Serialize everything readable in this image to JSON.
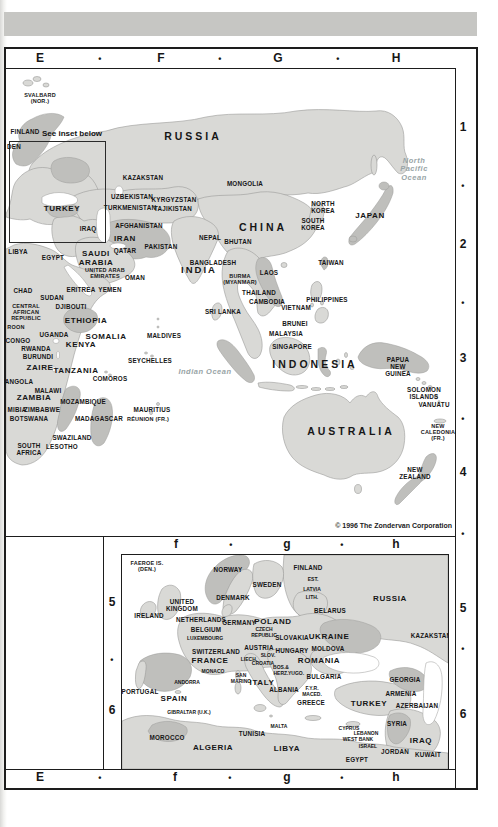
{
  "page": {
    "copyright": "© 1996 The Zondervan Corporation",
    "inset_note": "See inset below",
    "colors": {
      "top_bar": "#c6c6c3",
      "land": "#d9d9d6",
      "land_dark": "#bfbfbc",
      "ocean": "#ffffff",
      "frame": "#1d1d1d"
    }
  },
  "grid": {
    "top": [
      {
        "t": "E",
        "x": 40,
        "y": 59,
        "cls": "grid"
      },
      {
        "t": "•",
        "x": 100,
        "y": 59,
        "cls": "dot"
      },
      {
        "t": "F",
        "x": 161,
        "y": 59,
        "cls": "grid"
      },
      {
        "t": "•",
        "x": 220,
        "y": 59,
        "cls": "dot"
      },
      {
        "t": "G",
        "x": 278,
        "y": 59,
        "cls": "grid"
      },
      {
        "t": "•",
        "x": 338,
        "y": 59,
        "cls": "dot"
      },
      {
        "t": "H",
        "x": 396,
        "y": 59,
        "cls": "grid"
      }
    ],
    "bottom": [
      {
        "t": "E",
        "x": 40,
        "y": 778,
        "cls": "grid"
      },
      {
        "t": "•",
        "x": 100,
        "y": 778,
        "cls": "dot"
      },
      {
        "t": "f",
        "x": 175,
        "y": 778,
        "cls": "grid"
      },
      {
        "t": "•",
        "x": 230,
        "y": 778,
        "cls": "dot"
      },
      {
        "t": "g",
        "x": 287,
        "y": 778,
        "cls": "grid"
      },
      {
        "t": "•",
        "x": 342,
        "y": 778,
        "cls": "dot"
      },
      {
        "t": "h",
        "x": 396,
        "y": 778,
        "cls": "grid"
      }
    ],
    "right": [
      {
        "t": "1",
        "x": 463,
        "y": 128,
        "cls": "grid"
      },
      {
        "t": "•",
        "x": 463,
        "y": 186,
        "cls": "dot"
      },
      {
        "t": "2",
        "x": 463,
        "y": 245,
        "cls": "grid"
      },
      {
        "t": "•",
        "x": 463,
        "y": 303,
        "cls": "dot"
      },
      {
        "t": "3",
        "x": 463,
        "y": 359,
        "cls": "grid"
      },
      {
        "t": "•",
        "x": 463,
        "y": 419,
        "cls": "dot"
      },
      {
        "t": "4",
        "x": 463,
        "y": 473,
        "cls": "grid"
      },
      {
        "t": "•",
        "x": 463,
        "y": 534,
        "cls": "dot"
      },
      {
        "t": "5",
        "x": 463,
        "y": 609,
        "cls": "grid"
      },
      {
        "t": "•",
        "x": 463,
        "y": 649,
        "cls": "dot"
      },
      {
        "t": "6",
        "x": 463,
        "y": 715,
        "cls": "grid"
      }
    ],
    "inset_top": [
      {
        "t": "f",
        "x": 176,
        "y": 545,
        "cls": "grid"
      },
      {
        "t": "•",
        "x": 231,
        "y": 545,
        "cls": "dot"
      },
      {
        "t": "g",
        "x": 287,
        "y": 545,
        "cls": "grid"
      },
      {
        "t": "•",
        "x": 342,
        "y": 545,
        "cls": "dot"
      },
      {
        "t": "h",
        "x": 396,
        "y": 545,
        "cls": "grid"
      }
    ],
    "inset_left": [
      {
        "t": "5",
        "x": 112,
        "y": 603,
        "cls": "grid"
      },
      {
        "t": "•",
        "x": 112,
        "y": 660,
        "cls": "dot"
      },
      {
        "t": "6",
        "x": 112,
        "y": 711,
        "cls": "grid"
      }
    ]
  },
  "main_map": {
    "labels": [
      {
        "t": "SVALBARD\n(NOR.)",
        "x": 34,
        "y": 29,
        "cls": "sm"
      },
      {
        "t": "FINLAND",
        "x": 19,
        "y": 63
      },
      {
        "t": "DEN",
        "x": 8,
        "y": 78
      },
      {
        "t": "RUSSIA",
        "x": 187,
        "y": 68,
        "cls": "xl"
      },
      {
        "t": "KAZAKSTAN",
        "x": 137,
        "y": 109
      },
      {
        "t": "MONGOLIA",
        "x": 239,
        "y": 115
      },
      {
        "t": "UZBEKISTAN",
        "x": 126,
        "y": 128
      },
      {
        "t": "KYRGYZSTAN",
        "x": 168,
        "y": 131
      },
      {
        "t": "TURKMENISTAN",
        "x": 124,
        "y": 139
      },
      {
        "t": "TAJIKISTAN",
        "x": 167,
        "y": 140
      },
      {
        "t": "TURKEY",
        "x": 56,
        "y": 140,
        "cls": "lg"
      },
      {
        "t": "IRAQ",
        "x": 82,
        "y": 160
      },
      {
        "t": "IRAN",
        "x": 119,
        "y": 170,
        "cls": "lg"
      },
      {
        "t": "AFGHANISTAN",
        "x": 133,
        "y": 157
      },
      {
        "t": "PAKISTAN",
        "x": 155,
        "y": 178
      },
      {
        "t": "NEPAL",
        "x": 204,
        "y": 169
      },
      {
        "t": "BHUTAN",
        "x": 232,
        "y": 173
      },
      {
        "t": "CHINA",
        "x": 257,
        "y": 159,
        "cls": "xl"
      },
      {
        "t": "NORTH\nKOREA",
        "x": 317,
        "y": 138
      },
      {
        "t": "SOUTH\nKOREA",
        "x": 307,
        "y": 155
      },
      {
        "t": "JAPAN",
        "x": 364,
        "y": 147,
        "cls": "lg"
      },
      {
        "t": "North\nPacific\nOcean",
        "x": 408,
        "y": 101,
        "cls": "ocean"
      },
      {
        "t": "QATAR",
        "x": 119,
        "y": 182
      },
      {
        "t": "SAUDI\nARABIA",
        "x": 90,
        "y": 190,
        "cls": "lg"
      },
      {
        "t": "EGYPT",
        "x": 47,
        "y": 189
      },
      {
        "t": "LIBYA",
        "x": 12,
        "y": 183
      },
      {
        "t": "UNITED ARAB\nEMIRATES",
        "x": 99,
        "y": 204,
        "cls": "sm"
      },
      {
        "t": "OMAN",
        "x": 129,
        "y": 209
      },
      {
        "t": "BANGLADESH",
        "x": 207,
        "y": 194
      },
      {
        "t": "INDIA",
        "x": 193,
        "y": 201,
        "cls": "xl2"
      },
      {
        "t": "BURMA\n(MYANMAR)",
        "x": 234,
        "y": 210,
        "cls": "sm"
      },
      {
        "t": "ERITREA",
        "x": 75,
        "y": 221
      },
      {
        "t": "YEMEN",
        "x": 104,
        "y": 221
      },
      {
        "t": "CHAD",
        "x": 17,
        "y": 222
      },
      {
        "t": "SUDAN",
        "x": 46,
        "y": 229
      },
      {
        "t": "DJIBOUTI",
        "x": 65,
        "y": 238
      },
      {
        "t": "CENTRAL\nAFRICAN\nREPUBLIC",
        "x": 20,
        "y": 243,
        "cls": "sm"
      },
      {
        "t": "ROON",
        "x": 10,
        "y": 258,
        "cls": "sm"
      },
      {
        "t": "ETHIOPIA",
        "x": 80,
        "y": 252,
        "cls": "lg"
      },
      {
        "t": "SOMALIA",
        "x": 100,
        "y": 268,
        "cls": "lg"
      },
      {
        "t": "UGANDA",
        "x": 48,
        "y": 266
      },
      {
        "t": "KENYA",
        "x": 75,
        "y": 276,
        "cls": "lg"
      },
      {
        "t": "CONGO",
        "x": 12,
        "y": 272
      },
      {
        "t": "RWANDA",
        "x": 30,
        "y": 280
      },
      {
        "t": "BURUNDI",
        "x": 32,
        "y": 288
      },
      {
        "t": "ZAIRE",
        "x": 34,
        "y": 299,
        "cls": "lg"
      },
      {
        "t": "TANZANIA",
        "x": 70,
        "y": 302,
        "cls": "lg"
      },
      {
        "t": "MALDIVES",
        "x": 158,
        "y": 267
      },
      {
        "t": "SRI LANKA",
        "x": 217,
        "y": 243
      },
      {
        "t": "SEYCHELLES",
        "x": 144,
        "y": 292
      },
      {
        "t": "Indian Ocean",
        "x": 199,
        "y": 303,
        "cls": "ocean"
      },
      {
        "t": "COMOROS",
        "x": 104,
        "y": 310
      },
      {
        "t": "ANGOLA",
        "x": 13,
        "y": 313
      },
      {
        "t": "MALAWI",
        "x": 42,
        "y": 322
      },
      {
        "t": "ZAMBIA",
        "x": 28,
        "y": 329,
        "cls": "lg"
      },
      {
        "t": "MOZAMBIQUE",
        "x": 77,
        "y": 333
      },
      {
        "t": "MIBIA",
        "x": 11,
        "y": 341
      },
      {
        "t": "ZIMBABWE",
        "x": 36,
        "y": 341
      },
      {
        "t": "BOTSWANA",
        "x": 23,
        "y": 350
      },
      {
        "t": "MADAGASCAR",
        "x": 93,
        "y": 350
      },
      {
        "t": "MAURITIUS",
        "x": 146,
        "y": 341
      },
      {
        "t": "RÉUNION (FR.)",
        "x": 142,
        "y": 350,
        "cls": "sm"
      },
      {
        "t": "SWAZILAND",
        "x": 66,
        "y": 369
      },
      {
        "t": "SOUTH\nAFRICA",
        "x": 23,
        "y": 380
      },
      {
        "t": "LESOTHO",
        "x": 56,
        "y": 378
      },
      {
        "t": "THAILAND",
        "x": 253,
        "y": 224
      },
      {
        "t": "LAOS",
        "x": 263,
        "y": 204
      },
      {
        "t": "CAMBODIA",
        "x": 261,
        "y": 233
      },
      {
        "t": "VIETNAM",
        "x": 290,
        "y": 239
      },
      {
        "t": "TAIWAN",
        "x": 325,
        "y": 194
      },
      {
        "t": "PHILIPPINES",
        "x": 321,
        "y": 231
      },
      {
        "t": "BRUNEI",
        "x": 289,
        "y": 255
      },
      {
        "t": "MALAYSIA",
        "x": 280,
        "y": 265
      },
      {
        "t": "SINGAPORE",
        "x": 286,
        "y": 278
      },
      {
        "t": "INDONESIA",
        "x": 309,
        "y": 296,
        "cls": "xl"
      },
      {
        "t": "PAPUA\nNEW\nGUINEA",
        "x": 392,
        "y": 298
      },
      {
        "t": "SOLOMON\nISLANDS",
        "x": 418,
        "y": 324
      },
      {
        "t": "VANUATU",
        "x": 428,
        "y": 336
      },
      {
        "t": "NEW\nCALEDONIA\n(FR.)",
        "x": 432,
        "y": 363,
        "cls": "sm"
      },
      {
        "t": "AUSTRALIA",
        "x": 345,
        "y": 363,
        "cls": "xl"
      },
      {
        "t": "NEW\nZEALAND",
        "x": 409,
        "y": 404
      }
    ]
  },
  "inset_map": {
    "labels": [
      {
        "t": "FAEROE IS.\n(DEN.)",
        "x": 25,
        "y": 11,
        "cls": "sm"
      },
      {
        "t": "NORWAY",
        "x": 106,
        "y": 15
      },
      {
        "t": "FINLAND",
        "x": 186,
        "y": 13
      },
      {
        "t": "SWEDEN",
        "x": 145,
        "y": 30
      },
      {
        "t": "EST.",
        "x": 191,
        "y": 25,
        "cls": "xs"
      },
      {
        "t": "LATVIA",
        "x": 190,
        "y": 35,
        "cls": "xs"
      },
      {
        "t": "LITH.",
        "x": 190,
        "y": 43,
        "cls": "xs"
      },
      {
        "t": "RUSSIA",
        "x": 268,
        "y": 44,
        "cls": "lg"
      },
      {
        "t": "BELARUS",
        "x": 208,
        "y": 56
      },
      {
        "t": "UNITED\nKINGDOM",
        "x": 60,
        "y": 50
      },
      {
        "t": "IRELAND",
        "x": 27,
        "y": 61
      },
      {
        "t": "DENMARK",
        "x": 111,
        "y": 43
      },
      {
        "t": "NETHERLANDS",
        "x": 79,
        "y": 65
      },
      {
        "t": "BELGIUM",
        "x": 84,
        "y": 75
      },
      {
        "t": "LUXEMBOURG",
        "x": 83,
        "y": 84,
        "cls": "xs"
      },
      {
        "t": "GERMANY",
        "x": 117,
        "y": 68
      },
      {
        "t": "POLAND",
        "x": 151,
        "y": 67,
        "cls": "lg"
      },
      {
        "t": "CZECH\nREPUBLIC",
        "x": 142,
        "y": 78,
        "cls": "xs"
      },
      {
        "t": "SLOVAKIA",
        "x": 170,
        "y": 83
      },
      {
        "t": "UKRAINE",
        "x": 207,
        "y": 82,
        "cls": "lg"
      },
      {
        "t": "MOLDOVA",
        "x": 206,
        "y": 94
      },
      {
        "t": "KAZAKSTAN",
        "x": 309,
        "y": 81
      },
      {
        "t": "SWITZERLAND",
        "x": 94,
        "y": 97
      },
      {
        "t": "AUSTRIA",
        "x": 137,
        "y": 93
      },
      {
        "t": "LIECH.",
        "x": 127,
        "y": 105,
        "cls": "xs"
      },
      {
        "t": "SLOV.",
        "x": 146,
        "y": 101,
        "cls": "xs"
      },
      {
        "t": "HUNGARY",
        "x": 170,
        "y": 96
      },
      {
        "t": "FRANCE",
        "x": 88,
        "y": 106,
        "cls": "lg"
      },
      {
        "t": "CROATIA",
        "x": 141,
        "y": 109,
        "cls": "xs"
      },
      {
        "t": "BOS.&\nHERZ.",
        "x": 159,
        "y": 116,
        "cls": "xs"
      },
      {
        "t": "YUGO.",
        "x": 174,
        "y": 119,
        "cls": "xs"
      },
      {
        "t": "ROMANIA",
        "x": 197,
        "y": 106,
        "cls": "lg"
      },
      {
        "t": "MONACO",
        "x": 91,
        "y": 117,
        "cls": "xs"
      },
      {
        "t": "SAN\nMARINO",
        "x": 119,
        "y": 124,
        "cls": "xs"
      },
      {
        "t": "ITALY",
        "x": 140,
        "y": 128,
        "cls": "lg"
      },
      {
        "t": "BULGARIA",
        "x": 202,
        "y": 122
      },
      {
        "t": "ANDORRA",
        "x": 65,
        "y": 128,
        "cls": "xs"
      },
      {
        "t": "ALBANIA",
        "x": 162,
        "y": 135
      },
      {
        "t": "F.Y.R.\nMACED.",
        "x": 190,
        "y": 137,
        "cls": "xs"
      },
      {
        "t": "GREECE",
        "x": 189,
        "y": 148
      },
      {
        "t": "PORTUGAL",
        "x": 18,
        "y": 137
      },
      {
        "t": "SPAIN",
        "x": 52,
        "y": 144,
        "cls": "lg"
      },
      {
        "t": "GIBRALTAR (U.K.)",
        "x": 67,
        "y": 158,
        "cls": "xs"
      },
      {
        "t": "MOROCCO",
        "x": 45,
        "y": 183
      },
      {
        "t": "ALGERIA",
        "x": 91,
        "y": 193,
        "cls": "lg"
      },
      {
        "t": "TUNISIA",
        "x": 130,
        "y": 179
      },
      {
        "t": "MALTA",
        "x": 157,
        "y": 172,
        "cls": "xs"
      },
      {
        "t": "LIBYA",
        "x": 165,
        "y": 194,
        "cls": "lg"
      },
      {
        "t": "CYPRUS",
        "x": 227,
        "y": 174,
        "cls": "xs"
      },
      {
        "t": "TURKEY",
        "x": 247,
        "y": 149,
        "cls": "lg"
      },
      {
        "t": "GEORGIA",
        "x": 283,
        "y": 125
      },
      {
        "t": "ARMENIA",
        "x": 279,
        "y": 139
      },
      {
        "t": "AZERBAIJAN",
        "x": 295,
        "y": 151
      },
      {
        "t": "SYRIA",
        "x": 275,
        "y": 169
      },
      {
        "t": "LEBANON",
        "x": 244,
        "y": 179,
        "cls": "xs"
      },
      {
        "t": "WEST BANK",
        "x": 236,
        "y": 185,
        "cls": "xs"
      },
      {
        "t": "ISRAEL",
        "x": 246,
        "y": 192,
        "cls": "xs"
      },
      {
        "t": "JORDAN",
        "x": 273,
        "y": 197
      },
      {
        "t": "IRAQ",
        "x": 299,
        "y": 186,
        "cls": "lg"
      },
      {
        "t": "KUWAIT",
        "x": 306,
        "y": 200
      },
      {
        "t": "EGYPT",
        "x": 235,
        "y": 205
      }
    ]
  }
}
